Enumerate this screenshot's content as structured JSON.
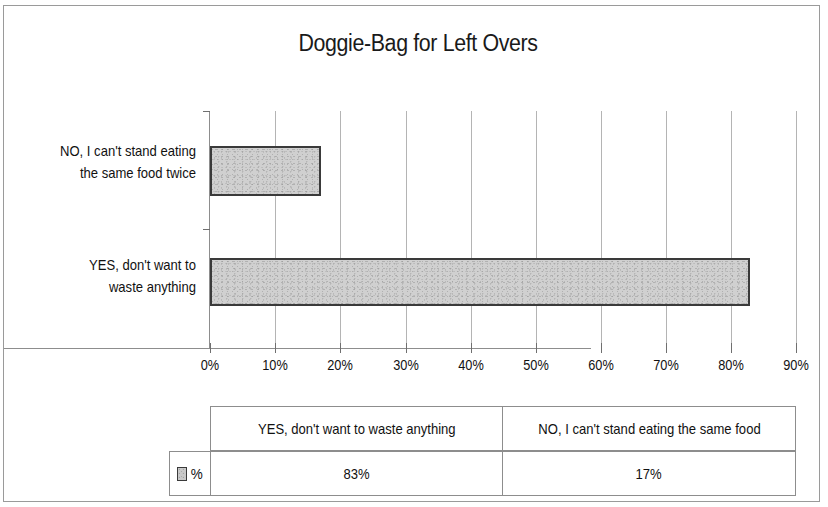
{
  "chart_data": {
    "type": "bar",
    "orientation": "horizontal",
    "title": "Doggie-Bag for Left Overs",
    "xlabel": "",
    "ylabel": "",
    "categories": [
      "YES, don't want to waste anything",
      "NO, I can't stand eating the same food twice"
    ],
    "category_labels_wrapped": [
      [
        "YES, don't want to",
        "waste anything"
      ],
      [
        "NO, I can't stand eating",
        "the same food twice"
      ]
    ],
    "values": [
      83,
      17
    ],
    "value_labels": [
      "83%",
      "17%"
    ],
    "series": [
      {
        "name": "%",
        "values": [
          83,
          17
        ]
      }
    ],
    "xlim": [
      0,
      90
    ],
    "xtick_labels": [
      "0%",
      "10%",
      "20%",
      "30%",
      "40%",
      "50%",
      "60%",
      "70%",
      "80%",
      "90%"
    ],
    "xtick_values": [
      0,
      10,
      20,
      30,
      40,
      50,
      60,
      70,
      80,
      90
    ],
    "grid": "vertical",
    "legend": {
      "position": "data-table-row-header",
      "entries": [
        "%"
      ]
    },
    "colors": {
      "bar_fill": "#d0d0d0",
      "bar_outline": "#3a3a3a",
      "gridline": "#b4b4b4",
      "axis": "#8d8d8d",
      "text": "#111111",
      "background": "#ffffff"
    }
  },
  "data_table": {
    "row_header_label": "%",
    "column_headers": [
      "YES, don't want to waste anything",
      "NO, I can't stand eating the same food"
    ],
    "rows": [
      {
        "label": "%",
        "cells": [
          "83%",
          "17%"
        ]
      }
    ]
  }
}
